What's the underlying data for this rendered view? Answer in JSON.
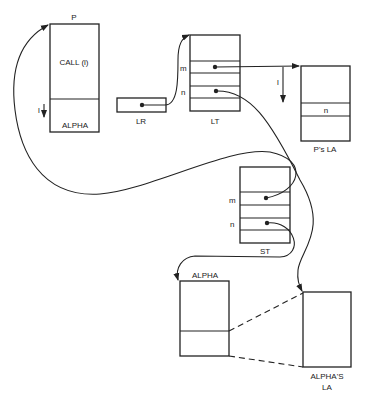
{
  "diagram": {
    "type": "memory-layout",
    "blocks": {
      "p": {
        "title": "P",
        "upper_label": "CALL (l)",
        "lower_label": "ALPHA",
        "pointer_label": "l"
      },
      "lr": {
        "caption": "LR"
      },
      "lt": {
        "caption": "LT",
        "row_labels": [
          "m",
          "n"
        ]
      },
      "ps_la": {
        "caption": "P's LA",
        "row_label": "n",
        "pointer_label": "l"
      },
      "st": {
        "caption": "ST",
        "row_labels": [
          "m",
          "n"
        ]
      },
      "alpha": {
        "title": "ALPHA"
      },
      "alphas_la": {
        "caption_line1": "ALPHA'S",
        "caption_line2": "LA"
      }
    },
    "edges": [
      {
        "from": "P.ALPHA",
        "to": "ST.m",
        "style": "curve"
      },
      {
        "from": "LR",
        "to": "LT",
        "style": "arrow"
      },
      {
        "from": "LT.m",
        "to": "P's LA",
        "style": "arrow"
      },
      {
        "from": "LT.n",
        "to": "ALPHA'S LA",
        "style": "arrow"
      },
      {
        "from": "ST.n",
        "to": "ALPHA",
        "style": "arrow"
      },
      {
        "from": "ALPHA.lower",
        "to": "ALPHA'S LA",
        "style": "dashed"
      },
      {
        "from": "P.bottom",
        "to": "P",
        "style": "arrow"
      }
    ]
  }
}
